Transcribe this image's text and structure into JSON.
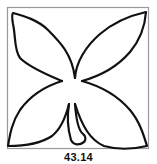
{
  "diagram": {
    "type": "line-art pattern block",
    "caption": "43.14",
    "colors": {
      "background": "#ffffff",
      "frame": "#9a9a9a",
      "stroke": "#111111"
    },
    "elements": [
      {
        "name": "frame",
        "shape": "square"
      },
      {
        "name": "petal-top-left",
        "shape": "leaf"
      },
      {
        "name": "petal-top-right",
        "shape": "leaf"
      },
      {
        "name": "petal-bottom-left",
        "shape": "leaf"
      },
      {
        "name": "petal-bottom-right",
        "shape": "leaf"
      },
      {
        "name": "stem",
        "shape": "curved strip"
      }
    ]
  }
}
